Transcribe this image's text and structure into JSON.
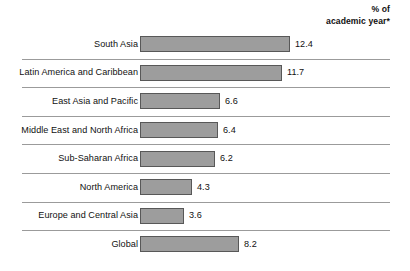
{
  "header": {
    "unit_line1": "% of",
    "unit_line2": "academic year*"
  },
  "style": {
    "bar_fill": "#9d9d9d",
    "bar_border": "#585858",
    "separator": "#9b9b9b",
    "text": "#111111",
    "background": "#ffffff"
  },
  "chart_data": {
    "type": "bar",
    "orientation": "horizontal",
    "title": "",
    "subtitle": "",
    "xlabel": "% of academic year*",
    "ylabel": "",
    "grid": false,
    "legend": null,
    "xlim": [
      0,
      12.4
    ],
    "px_per_unit": 12.1,
    "categories": [
      "South Asia",
      "Latin America and Caribbean",
      "East Asia and Pacific",
      "Middle East and North Africa",
      "Sub-Saharan Africa",
      "North America",
      "Europe and Central Asia",
      "Global"
    ],
    "values": [
      12.4,
      11.7,
      6.6,
      6.4,
      6.2,
      4.3,
      3.6,
      8.2
    ],
    "value_labels": [
      "12.4",
      "11.7",
      "6.6",
      "6.4",
      "6.2",
      "4.3",
      "3.6",
      "8.2"
    ],
    "rows": [
      {
        "label": "South Asia",
        "value": 12.4,
        "value_label": "12.4",
        "bar_px": 150
      },
      {
        "label": "Latin America and Caribbean",
        "value": 11.7,
        "value_label": "11.7",
        "bar_px": 142
      },
      {
        "label": "East Asia and Pacific",
        "value": 6.6,
        "value_label": "6.6",
        "bar_px": 80
      },
      {
        "label": "Middle East and North Africa",
        "value": 6.4,
        "value_label": "6.4",
        "bar_px": 78
      },
      {
        "label": "Sub-Saharan Africa",
        "value": 6.2,
        "value_label": "6.2",
        "bar_px": 75
      },
      {
        "label": "North America",
        "value": 4.3,
        "value_label": "4.3",
        "bar_px": 52
      },
      {
        "label": "Europe and Central Asia",
        "value": 3.6,
        "value_label": "3.6",
        "bar_px": 44
      },
      {
        "label": "Global",
        "value": 8.2,
        "value_label": "8.2",
        "bar_px": 99
      }
    ]
  }
}
